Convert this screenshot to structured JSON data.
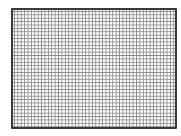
{
  "figure": {
    "type": "grid",
    "columns": 48,
    "rows": 35,
    "colors": {
      "border": "#3a3a3a",
      "grid_line": "#8a8a8a",
      "background": "#ffffff"
    }
  }
}
